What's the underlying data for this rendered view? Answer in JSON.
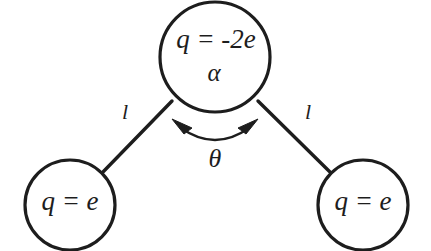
{
  "figure": {
    "background_color": "#ffffff",
    "stroke_color": "#1d1d1d"
  },
  "nodes": {
    "apex": {
      "name": "central-negative-charge",
      "charge_label": "q = -2e",
      "angle_label": "α",
      "cx": 215,
      "cy": 57,
      "r": 55
    },
    "left": {
      "name": "left-positive-charge",
      "charge_label": "q = e",
      "cx": 70,
      "cy": 205,
      "r": 45
    },
    "right": {
      "name": "right-positive-charge",
      "charge_label": "q = e",
      "cx": 363,
      "cy": 205,
      "r": 45
    }
  },
  "bonds": {
    "left_length_label": "l",
    "right_length_label": "l"
  },
  "angle": {
    "label": "θ",
    "name": "bond-angle-theta"
  }
}
